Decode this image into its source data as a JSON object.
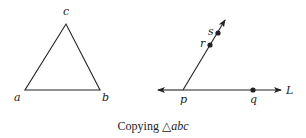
{
  "figure": {
    "triangle": {
      "vertices": [
        {
          "name": "a",
          "x": 25,
          "y": 90
        },
        {
          "name": "b",
          "x": 100,
          "y": 90
        },
        {
          "name": "c",
          "x": 66,
          "y": 24
        }
      ],
      "labels": {
        "a": "a",
        "b": "b",
        "c": "c"
      }
    },
    "construction": {
      "line_label": "L",
      "points": {
        "p": "p",
        "q": "q",
        "r": "r",
        "s": "s"
      }
    },
    "caption": {
      "prefix": "Copying ",
      "symbol": "△",
      "name": "abc"
    }
  },
  "colors": {
    "stroke": "#222222",
    "background": "#ffffff"
  }
}
